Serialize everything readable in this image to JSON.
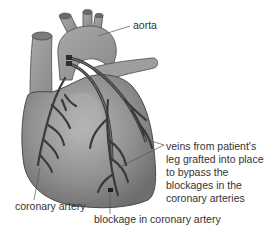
{
  "figure": {
    "labels": {
      "aorta": "aorta",
      "veins": [
        "veins from patient's",
        "leg grafted into place",
        "to bypass the",
        "blockages in the",
        "coronary arteries"
      ],
      "coronary_artery": "coronary artery",
      "blockage": "blockage in coronary artery"
    },
    "colors": {
      "heart_fill": "#8e8e8e",
      "heart_light": "#b5b5b5",
      "vessel_dark": "#3a3a3a",
      "outline": "#4a4a4a",
      "leader_line": "#555555",
      "text": "#333333"
    }
  }
}
